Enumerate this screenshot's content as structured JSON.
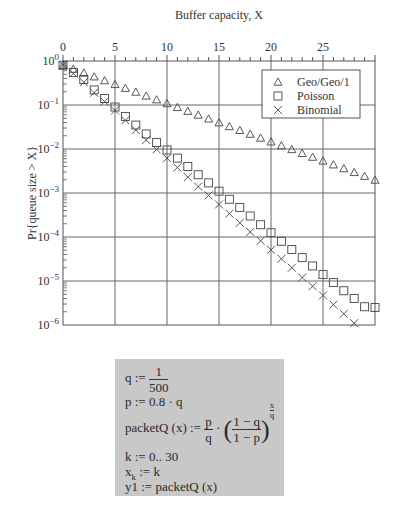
{
  "chart_data": {
    "type": "scatter",
    "title": "",
    "xlabel": "Buffer capacity, X",
    "ylabel": "Pr{queue size > X}",
    "x_axis_position": "top",
    "xlim": [
      0,
      30
    ],
    "ylim": [
      1e-06,
      1
    ],
    "yscale": "log",
    "x_ticks": [
      0,
      5,
      10,
      15,
      20,
      25
    ],
    "x_tick_labels": [
      "0",
      "5",
      "10",
      "15",
      "20",
      "25"
    ],
    "y_ticks": [
      1,
      0.1,
      0.01,
      0.001,
      0.0001,
      1e-05,
      1e-06
    ],
    "y_tick_labels": [
      "10^0",
      "10^-1",
      "10^-2",
      "10^-3",
      "10^-4",
      "10^-5",
      "10^-6"
    ],
    "grid": true,
    "legend_position": "upper right",
    "series": [
      {
        "name": "Geo/Geo/1",
        "marker": "triangle",
        "x": [
          0,
          1,
          2,
          3,
          4,
          5,
          6,
          7,
          8,
          9,
          10,
          11,
          12,
          13,
          14,
          15,
          16,
          17,
          18,
          19,
          20,
          21,
          22,
          23,
          24,
          25,
          26,
          27,
          28,
          29,
          30
        ],
        "values": [
          0.8,
          0.655,
          0.536,
          0.439,
          0.359,
          0.294,
          0.241,
          0.197,
          0.161,
          0.132,
          0.108,
          0.0885,
          0.0724,
          0.0593,
          0.0485,
          0.0397,
          0.0325,
          0.0266,
          0.0218,
          0.0178,
          0.0146,
          0.0119,
          0.00978,
          0.008,
          0.00655,
          0.00536,
          0.00439,
          0.00359,
          0.00294,
          0.00241,
          0.00197
        ]
      },
      {
        "name": "Poisson",
        "marker": "square",
        "x": [
          0,
          1,
          2,
          3,
          4,
          5,
          6,
          7,
          8,
          9,
          10,
          11,
          12,
          13,
          14,
          15,
          16,
          17,
          18,
          19,
          20,
          21,
          22,
          23,
          24,
          25,
          26,
          27,
          28,
          29,
          30
        ],
        "values": [
          0.8,
          0.55,
          0.38,
          0.22,
          0.14,
          0.09,
          0.055,
          0.035,
          0.022,
          0.014,
          0.0095,
          0.0062,
          0.004,
          0.0026,
          0.0017,
          0.0011,
          0.00072,
          0.00047,
          0.0003,
          0.00019,
          0.000125,
          8e-05,
          5.2e-05,
          3.4e-05,
          2.2e-05,
          1.4e-05,
          9.2e-06,
          6e-06,
          4e-06,
          2.6e-06,
          2.5e-06
        ]
      },
      {
        "name": "Binomial",
        "marker": "x",
        "x": [
          0,
          1,
          2,
          3,
          4,
          5,
          6,
          7,
          8,
          9,
          10,
          11,
          12,
          13,
          14,
          15,
          16,
          17,
          18,
          19,
          20,
          21,
          22,
          23,
          24,
          25,
          26,
          27,
          28
        ],
        "values": [
          0.8,
          0.52,
          0.33,
          0.19,
          0.12,
          0.075,
          0.045,
          0.027,
          0.016,
          0.0098,
          0.0062,
          0.0038,
          0.0023,
          0.0014,
          0.00088,
          0.00055,
          0.00034,
          0.00021,
          0.00013,
          8.2e-05,
          5.1e-05,
          3.2e-05,
          2e-05,
          1.2e-05,
          7.6e-06,
          4.7e-06,
          2.9e-06,
          1.8e-06,
          1.1e-06
        ]
      }
    ]
  },
  "legend": {
    "items": [
      {
        "symbol": "△",
        "label": "Geo/Geo/1"
      },
      {
        "symbol": "□",
        "label": "Poisson"
      },
      {
        "symbol": "×",
        "label": "Binomial"
      }
    ]
  },
  "formulas": {
    "q_lhs": "q :=",
    "q_num": "1",
    "q_den": "500",
    "p_line": "p := 0.8 · q",
    "packet_lhs": "packetQ (x) :=",
    "packet_frac_num": "p",
    "packet_frac_den": "q",
    "packet_dot": "·",
    "packet_inner_num": "1 − q",
    "packet_inner_den": "1 − p",
    "packet_exp_num": "x",
    "packet_exp_den": "q",
    "k_line": "k := 0..   30",
    "xk_base": "x",
    "xk_sub": "k",
    "xk_rhs": " := k",
    "y1_line": "y1 := packetQ (x)"
  }
}
